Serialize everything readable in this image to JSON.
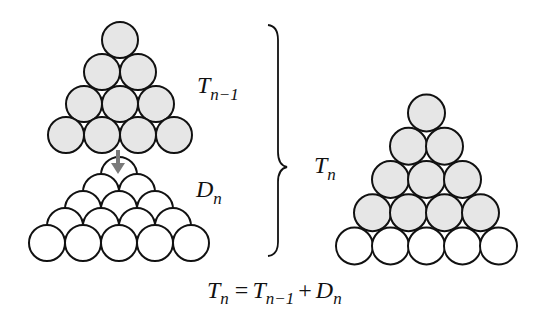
{
  "diagram": {
    "labels": {
      "t_prev": {
        "base": "T",
        "sub": "n−1"
      },
      "d_n": {
        "base": "D",
        "sub": "n"
      },
      "t_n": {
        "base": "T",
        "sub": "n"
      }
    },
    "equation": {
      "lhs_base": "T",
      "lhs_sub": "n",
      "eq": "=",
      "t1_base": "T",
      "t1_sub": "n−1",
      "plus": "+",
      "t2_base": "D",
      "t2_sub": "n"
    },
    "colors": {
      "filled": "#e6e6e6",
      "empty": "#ffffff",
      "stroke": "#111111",
      "arrow": "#7a7a7a"
    },
    "left_top_triangle": {
      "rows": 4,
      "filled": true,
      "count": 10
    },
    "left_bottom_triangle": {
      "rows": 5,
      "filled": false,
      "count": 15
    },
    "right_triangle": {
      "filled_rows": 4,
      "empty_rows": 1,
      "count": 15
    }
  }
}
